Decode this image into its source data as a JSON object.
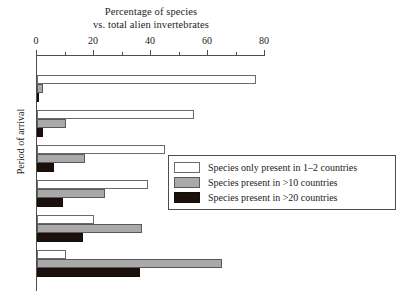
{
  "chart_data": {
    "type": "bar",
    "orientation": "horizontal",
    "title": "Percentage of species vs. total alien invertebrates",
    "title_lines": [
      "Percentage of species",
      "vs. total alien invertebrates"
    ],
    "xlabel": "Percentage of species vs. total alien invertebrates",
    "ylabel": "Period of arrival",
    "xlim": [
      0,
      80
    ],
    "ylim_categories": 6,
    "grid": false,
    "axis_position": "top",
    "xticks": [
      0,
      20,
      40,
      60,
      80
    ],
    "xticklabels": [
      "0",
      "20",
      "40",
      "60",
      "80"
    ],
    "xminorticks": [
      10,
      30,
      50,
      70
    ],
    "categories": [
      "",
      "",
      "",
      "",
      "",
      ""
    ],
    "yticklabels_shown": false,
    "legend_position": "center-right",
    "series": [
      {
        "name": "Species only present in 1–2 countries",
        "color": "#ffffff",
        "values": [
          77,
          55,
          45,
          39,
          20,
          10
        ]
      },
      {
        "name": "Species present in >10 countries",
        "color": "#a9a9a9",
        "values": [
          2,
          10,
          17,
          24,
          37,
          65
        ]
      },
      {
        "name": "Species present in >20 countries",
        "color": "#1b100b",
        "values": [
          0.5,
          2,
          6,
          9,
          16,
          36
        ]
      }
    ]
  },
  "axis": {
    "y_title": "Period of arrival",
    "x_tick_labels": [
      "0",
      "20",
      "40",
      "60",
      "80"
    ]
  },
  "title": {
    "line1": "Percentage of species",
    "line2": "vs. total alien invertebrates"
  },
  "legend": {
    "items": [
      {
        "label": "Species only present in 1–2 countries",
        "swatch": "s0"
      },
      {
        "label": "Species present in >10 countries",
        "swatch": "s1"
      },
      {
        "label": "Species present in >20 countries",
        "swatch": "s2"
      }
    ]
  }
}
